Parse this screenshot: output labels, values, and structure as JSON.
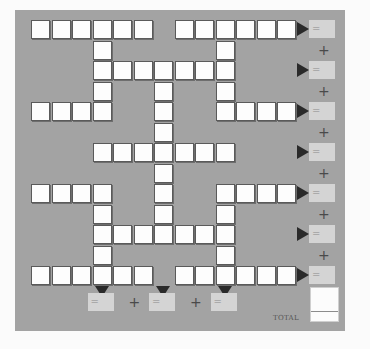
{
  "puzzle": {
    "grid": {
      "columns_x": [
        31,
        51.5,
        72,
        92.5,
        113,
        133.5,
        154,
        174.5,
        195,
        215.5,
        236,
        256.5,
        277
      ],
      "rows_y": [
        20,
        40.5,
        61,
        81.5,
        102,
        122.5,
        143,
        163.5,
        184,
        204.5,
        225,
        245.5,
        266
      ],
      "rows": [
        [
          0,
          1,
          2,
          3,
          4,
          5,
          7,
          8,
          9,
          10,
          11,
          12
        ],
        [
          3,
          9
        ],
        [
          3,
          4,
          5,
          6,
          7,
          8,
          9
        ],
        [
          3,
          6,
          9
        ],
        [
          0,
          1,
          2,
          3,
          6,
          9,
          10,
          11,
          12
        ],
        [
          6
        ],
        [
          3,
          4,
          5,
          6,
          7,
          8,
          9
        ],
        [
          6
        ],
        [
          0,
          1,
          2,
          3,
          6,
          9,
          10,
          11,
          12
        ],
        [
          3,
          6,
          9
        ],
        [
          3,
          4,
          5,
          6,
          7,
          8,
          9
        ],
        [
          3,
          9
        ],
        [
          0,
          1,
          2,
          3,
          4,
          5,
          7,
          8,
          9,
          10,
          11,
          12
        ]
      ]
    },
    "row_sums": {
      "rows": [
        0,
        2,
        4,
        6,
        8,
        10,
        12
      ],
      "equals_sign": "=",
      "plus_sign": "+",
      "values": [
        "",
        "",
        "",
        "",
        "",
        "",
        ""
      ]
    },
    "column_sums": {
      "columns": [
        3,
        6,
        9
      ],
      "equals_sign": "=",
      "plus_sign": "+",
      "values": [
        "",
        "",
        ""
      ]
    },
    "total": {
      "label": "TOTAL",
      "value": ""
    }
  },
  "colors": {
    "panel": "#a3a3a3",
    "cell": "#fdfdfd",
    "answer_box": "#d4d4d4",
    "arrow": "#2a2a2a"
  }
}
